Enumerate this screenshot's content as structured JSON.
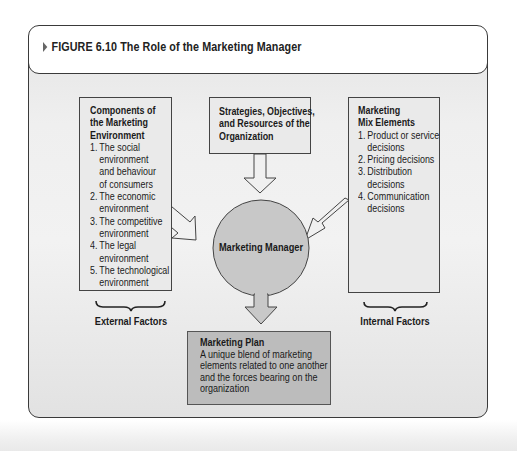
{
  "figure": {
    "marker": "triangle-bullet",
    "title": "FIGURE 6.10 The Role of the Marketing Manager"
  },
  "external_box": {
    "heading_lines": [
      "Components of",
      "the Marketing",
      "Environment"
    ],
    "items": [
      {
        "num": "1.",
        "lines": [
          "The social",
          "environment",
          "and behaviour",
          "of consumers"
        ]
      },
      {
        "num": "2.",
        "lines": [
          "The economic",
          "environment"
        ]
      },
      {
        "num": "3.",
        "lines": [
          "The competitive",
          "environment"
        ]
      },
      {
        "num": "4.",
        "lines": [
          "The legal",
          "environment"
        ]
      },
      {
        "num": "5.",
        "lines": [
          "The technological",
          "environment"
        ]
      }
    ],
    "bracket_label": "External Factors"
  },
  "strategy_box": {
    "lines": [
      "Strategies, Objectives,",
      "and Resources of the",
      "Organization"
    ]
  },
  "internal_box": {
    "heading_lines": [
      "Marketing",
      "Mix Elements"
    ],
    "items": [
      {
        "num": "1.",
        "lines": [
          "Product or service",
          "decisions"
        ]
      },
      {
        "num": "2.",
        "lines": [
          "Pricing decisions"
        ]
      },
      {
        "num": "3.",
        "lines": [
          "Distribution",
          "decisions"
        ]
      },
      {
        "num": "4.",
        "lines": [
          "Communication",
          "decisions"
        ]
      }
    ],
    "bracket_label": "Internal Factors"
  },
  "center": {
    "label": "Marketing Manager",
    "fill": "#c8c8c8"
  },
  "plan_box": {
    "heading": "Marketing Plan",
    "lines": [
      "A unique blend of marketing",
      "elements related to one another",
      "and the forces bearing on the",
      "organization"
    ],
    "fill": "#bcbcbc"
  },
  "arrows": [
    {
      "from": "external_box",
      "to": "center",
      "style": "hollow"
    },
    {
      "from": "strategy_box",
      "to": "center",
      "style": "hollow"
    },
    {
      "from": "internal_box",
      "to": "center",
      "style": "hollow"
    },
    {
      "from": "center",
      "to": "plan_box",
      "style": "filled"
    }
  ]
}
